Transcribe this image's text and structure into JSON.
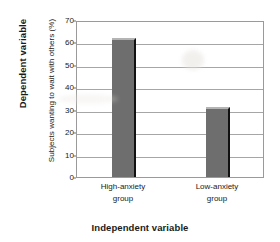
{
  "chart_data": {
    "type": "bar",
    "title": "",
    "categories": [
      "High-anxiety group",
      "Low-anxiety group"
    ],
    "category_lines": [
      [
        "High-anxiety",
        "group"
      ],
      [
        "Low-anxiety",
        "group"
      ]
    ],
    "values": [
      62,
      31
    ],
    "xlabel": "Independent variable",
    "ylabel": "Subjects wanting to wait with others (%)",
    "ylim": [
      0,
      70
    ],
    "ytick_step": 10,
    "yticks": [
      70,
      60,
      50,
      40,
      30,
      20,
      10,
      0
    ],
    "ytick_labels": [
      "70",
      "60",
      "50",
      "40",
      "30",
      "20",
      "10",
      "0"
    ],
    "grid": true,
    "legend": false,
    "legend_position": "none",
    "outer_ylabel": "Dependent variable",
    "outer_xlabel": "Independent variable",
    "bar_fill_color": "#6e6e6e",
    "bar_edge_color": "#111111",
    "bar_highlight_color": "#b4b4b4",
    "gridline_color": "#a6a6a6",
    "axis_color": "#9a9a9a",
    "background_color": "#ffffff"
  }
}
